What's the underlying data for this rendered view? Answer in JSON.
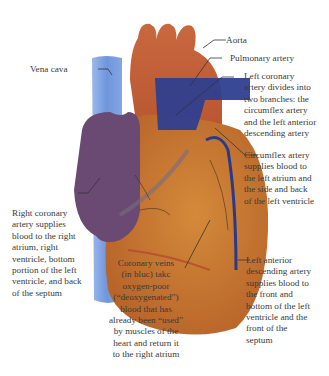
{
  "colors": {
    "heart_body": "#c8782e",
    "aorta": "#b5532e",
    "pulmonary_artery": "#2f3f8f",
    "vena_cava": "#7ea3e0",
    "right_atrium": "#6a4a72",
    "coronary_vein": "#2a3a8a",
    "coronary_artery": "#b84a2a",
    "leader_line": "#333333",
    "text": "#3a3a3a"
  },
  "labels": {
    "aorta": "Aorta",
    "pulmonary_artery": "Pulmonary artery",
    "vena_cava": "Vena cava",
    "left_coronary": [
      "Left coronary",
      "artery divides into",
      "two branches: the",
      "circumflex artery",
      "and the left anterior",
      "descending artery"
    ],
    "circumflex": [
      "Circumflex artery",
      "supplies blood to",
      "the left atrium and",
      "the side and back",
      "of the left ventricle"
    ],
    "right_coronary": [
      "Right coronary",
      "artery supplies",
      "blood to the right",
      "atrium, right",
      "ventricle, bottom",
      "portion of the left",
      "ventricle, and back",
      "of the septum"
    ],
    "coronary_veins": [
      "Coronary veins",
      "(in bluc) takc",
      "oxygen-poor",
      "(“deoxygenated”)",
      "blood that has",
      "already been “used”",
      "by muscles of the",
      "heart and return it",
      "to the right atrium"
    ],
    "left_anterior": [
      "Left anterior",
      "descending artery",
      "supplies blood to",
      "the front and",
      "bottom of the left",
      "ventricle and the",
      "front of the",
      "septum"
    ]
  }
}
